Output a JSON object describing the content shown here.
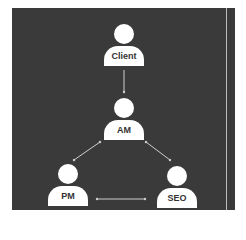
{
  "diagram": {
    "background": "#3a3a3a",
    "node_color": "#ffffff",
    "edge_color": "#cfcfcf",
    "nodes": [
      {
        "id": "client",
        "label": "Client"
      },
      {
        "id": "am",
        "label": "AM"
      },
      {
        "id": "pm",
        "label": "PM"
      },
      {
        "id": "seo",
        "label": "SEO"
      }
    ],
    "edges": [
      {
        "from": "Client",
        "to": "AM",
        "direction": "one-way"
      },
      {
        "from": "AM",
        "to": "PM",
        "direction": "two-way"
      },
      {
        "from": "AM",
        "to": "SEO",
        "direction": "two-way"
      },
      {
        "from": "PM",
        "to": "SEO",
        "direction": "two-way"
      }
    ]
  }
}
